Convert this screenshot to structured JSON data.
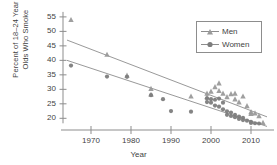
{
  "chart_data": {
    "type": "scatter",
    "title": "",
    "xlabel": "Year",
    "ylabel_line1": "Percent of 18–24 Year",
    "ylabel_line2": "Olds Who Smoke",
    "xlim": [
      1963,
      2015
    ],
    "ylim": [
      17,
      56
    ],
    "xticks": [
      1970,
      1980,
      1990,
      2000,
      2010
    ],
    "yticks": [
      20,
      25,
      30,
      35,
      40,
      45,
      50,
      55
    ],
    "grid": false,
    "legend_position": "upper right",
    "series": [
      {
        "name": "Men",
        "marker": "triangle",
        "color": "#9a9a9a",
        "points": [
          [
            1965,
            54.0
          ],
          [
            1974,
            42.0
          ],
          [
            1979,
            34.8
          ],
          [
            1985,
            30.2
          ],
          [
            1985,
            28.2
          ],
          [
            1995,
            27.6
          ],
          [
            1999,
            28.6
          ],
          [
            1999,
            27.4
          ],
          [
            2000,
            29.3
          ],
          [
            2001,
            30.8
          ],
          [
            2002,
            32.1
          ],
          [
            2002,
            29.5
          ],
          [
            2003,
            28.6
          ],
          [
            2004,
            27.4
          ],
          [
            2005,
            28.4
          ],
          [
            2006,
            28.6
          ],
          [
            2006,
            26.6
          ],
          [
            2007,
            25.6
          ],
          [
            2008,
            27.6
          ],
          [
            2009,
            24.3
          ],
          [
            2010,
            22.2
          ],
          [
            2010,
            21.6
          ],
          [
            2011,
            21.8
          ],
          [
            2012,
            20.8
          ],
          [
            2013,
            18.5
          ]
        ],
        "trend_line": {
          "x": [
            1964,
            2014
          ],
          "y": [
            47.0,
            20.5
          ]
        }
      },
      {
        "name": "Women",
        "marker": "circle",
        "color": "#7d7d7d",
        "points": [
          [
            1965,
            38.2
          ],
          [
            1974,
            34.4
          ],
          [
            1979,
            34.3
          ],
          [
            1985,
            28.0
          ],
          [
            1988,
            26.6
          ],
          [
            1990,
            22.5
          ],
          [
            1995,
            22.3
          ],
          [
            1999,
            26.8
          ],
          [
            1999,
            25.6
          ],
          [
            2000,
            26.6
          ],
          [
            2000,
            25.4
          ],
          [
            2001,
            26.4
          ],
          [
            2001,
            24.4
          ],
          [
            2002,
            26.8
          ],
          [
            2002,
            24.0
          ],
          [
            2003,
            25.4
          ],
          [
            2003,
            23.1
          ],
          [
            2004,
            22.4
          ],
          [
            2004,
            21.2
          ],
          [
            2005,
            22.0
          ],
          [
            2005,
            20.8
          ],
          [
            2006,
            21.2
          ],
          [
            2006,
            20.4
          ],
          [
            2007,
            20.6
          ],
          [
            2007,
            19.8
          ],
          [
            2008,
            20.2
          ],
          [
            2008,
            19.4
          ],
          [
            2009,
            19.2
          ],
          [
            2010,
            18.8
          ],
          [
            2010,
            18.4
          ],
          [
            2011,
            18.3
          ],
          [
            2012,
            18.2
          ]
        ],
        "trend_line": {
          "x": [
            1964,
            2014
          ],
          "y": [
            40.0,
            17.2
          ]
        }
      }
    ]
  },
  "legend": {
    "items": [
      {
        "label": "Men"
      },
      {
        "label": "Women"
      }
    ]
  },
  "axis": {
    "x_title": "Year",
    "y_title_line1": "Percent of 18–24 Year",
    "y_title_line2": "Olds Who Smoke"
  }
}
